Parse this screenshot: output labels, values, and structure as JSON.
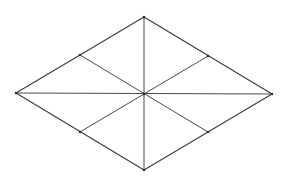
{
  "diagram": {
    "title": "",
    "shape": "rhombus",
    "colors": {
      "background": "#ffffff",
      "edge": "#3a3a3a",
      "segment": "#4a4a4a",
      "vertex": "#2a2a2a"
    },
    "vertices": {
      "top": [
        144,
        17
      ],
      "right": [
        272,
        94
      ],
      "bottom": [
        144,
        170
      ],
      "left": [
        16,
        93
      ],
      "center": [
        144,
        94
      ],
      "mid_upper_left": [
        80,
        55
      ],
      "mid_upper_right": [
        208,
        56
      ],
      "mid_lower_left": [
        80,
        132
      ],
      "mid_lower_right": [
        208,
        132
      ]
    },
    "edges": [
      {
        "name": "edge-top-right",
        "from": "top",
        "to": "right"
      },
      {
        "name": "edge-right-bottom",
        "from": "right",
        "to": "bottom"
      },
      {
        "name": "edge-bottom-left",
        "from": "bottom",
        "to": "left"
      },
      {
        "name": "edge-left-top",
        "from": "left",
        "to": "top"
      }
    ],
    "segments": [
      {
        "name": "diagonal-vertical",
        "from": "top",
        "to": "bottom"
      },
      {
        "name": "diagonal-horizontal",
        "from": "left",
        "to": "right"
      },
      {
        "name": "median-upper-left-to-lower-right",
        "from": "mid_upper_left",
        "to": "mid_lower_right"
      },
      {
        "name": "median-upper-right-to-lower-left",
        "from": "mid_upper_right",
        "to": "mid_lower_left"
      }
    ],
    "labels": []
  }
}
